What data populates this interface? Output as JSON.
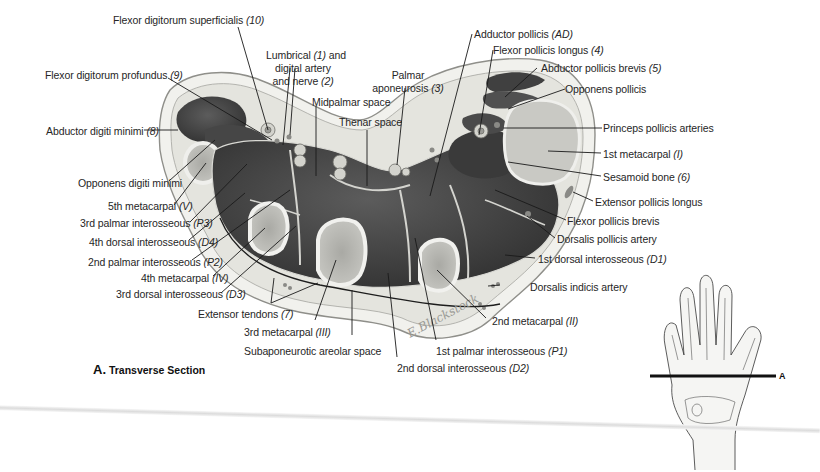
{
  "figure": {
    "caption_letter": "A.",
    "caption_text": "Transverse Section",
    "section_marker": "A",
    "signature": "E.Blackstock"
  },
  "labels": [
    {
      "id": "fds",
      "text": "Flexor digitorum superficialis",
      "ref": "(10)"
    },
    {
      "id": "fdp",
      "text": "Flexor digitorum profundus",
      "ref": "(9)"
    },
    {
      "id": "lumbrical_1",
      "text": "Lumbrical",
      "ref": "(1)",
      "text2": "and"
    },
    {
      "id": "lumbrical_2",
      "text": "digital artery"
    },
    {
      "id": "lumbrical_3",
      "text": "and nerve",
      "ref": "(2)"
    },
    {
      "id": "palmar_apo_1",
      "text": "Palmar"
    },
    {
      "id": "palmar_apo_2",
      "text": "aponeurosis",
      "ref": "(3)"
    },
    {
      "id": "midpalmar",
      "text": "Midpalmar space"
    },
    {
      "id": "thenar",
      "text": "Thenar space"
    },
    {
      "id": "abd_dig_min",
      "text": "Abductor digiti minimi",
      "ref": "(8)"
    },
    {
      "id": "opp_dig_min",
      "text": "Opponens digiti minimi"
    },
    {
      "id": "mc5",
      "text": "5th metacarpal",
      "ref": "(V)"
    },
    {
      "id": "p3",
      "text": "3rd palmar interosseous",
      "ref": "(P3)"
    },
    {
      "id": "d4",
      "text": "4th dorsal interosseous",
      "ref": "(D4)"
    },
    {
      "id": "p2",
      "text": "2nd palmar interosseous",
      "ref": "(P2)"
    },
    {
      "id": "mc4",
      "text": "4th metacarpal",
      "ref": "(IV)"
    },
    {
      "id": "d3",
      "text": "3rd dorsal interosseous",
      "ref": "(D3)"
    },
    {
      "id": "ext_tendons",
      "text": "Extensor tendons",
      "ref": "(7)"
    },
    {
      "id": "mc3",
      "text": "3rd metacarpal",
      "ref": "(III)"
    },
    {
      "id": "subapo",
      "text": "Subaponeurotic areolar space"
    },
    {
      "id": "d2",
      "text": "2nd dorsal interosseous",
      "ref": "(D2)"
    },
    {
      "id": "p1",
      "text": "1st palmar interosseous",
      "ref": "(P1)"
    },
    {
      "id": "mc2",
      "text": "2nd metacarpal",
      "ref": "(II)"
    },
    {
      "id": "dors_indicis",
      "text": "Dorsalis indicis artery"
    },
    {
      "id": "d1",
      "text": "1st dorsal interosseous",
      "ref": "(D1)"
    },
    {
      "id": "dors_pollicis",
      "text": "Dorsalis pollicis artery"
    },
    {
      "id": "fpb",
      "text": "Flexor pollicis brevis"
    },
    {
      "id": "epl",
      "text": "Extensor pollicis longus"
    },
    {
      "id": "sesamoid",
      "text": "Sesamoid bone",
      "ref": "(6)"
    },
    {
      "id": "mc1",
      "text": "1st metacarpal",
      "ref": "(I)"
    },
    {
      "id": "princeps",
      "text": "Princeps pollicis arteries"
    },
    {
      "id": "opp_pollicis",
      "text": "Opponens pollicis"
    },
    {
      "id": "apb",
      "text": "Abductor pollicis brevis",
      "ref": "(5)"
    },
    {
      "id": "fpl",
      "text": "Flexor pollicis longus",
      "ref": "(4)"
    },
    {
      "id": "add_pollicis",
      "text": "Adductor pollicis",
      "ref": "(AD)"
    }
  ],
  "colors": {
    "skin": "#f0f0ec",
    "subcut": "#e2e2dc",
    "muscle": "#3e3e3e",
    "muscle_light": "#5a5a5a",
    "bone": "#b9b9b4",
    "bone_cortex": "#ececea",
    "line": "#1a1a1a"
  }
}
